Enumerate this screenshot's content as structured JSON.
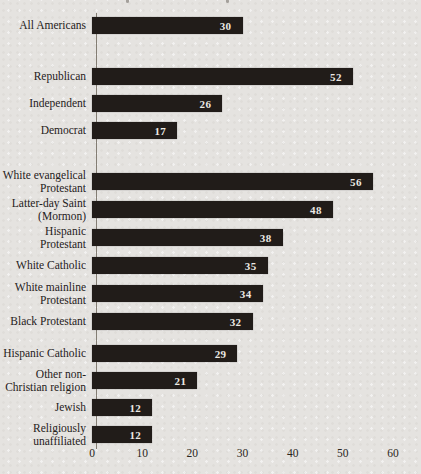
{
  "page": {
    "background_color": "#e5e3e0"
  },
  "chart_data": {
    "type": "bar",
    "orientation": "horizontal",
    "title": "",
    "xlabel": "",
    "ylabel": "",
    "xlim": [
      0,
      60
    ],
    "x_ticks": [
      "0",
      "10",
      "20",
      "30",
      "40",
      "50",
      "60"
    ],
    "grid": false,
    "legend": null,
    "bar_color": "#211c19",
    "value_label_color": "#ece9e4",
    "categories": [
      "All Americans",
      "Republican",
      "Independent",
      "Democrat",
      "White evangelical\nProtestant",
      "Latter-day Saint\n(Mormon)",
      "Hispanic\nProtestant",
      "White Catholic",
      "White mainline\nProtestant",
      "Black Protestant",
      "Hispanic Catholic",
      "Other non-\nChristian religion",
      "Jewish",
      "Religiously\nunaffiliated"
    ],
    "values": [
      30,
      52,
      26,
      17,
      56,
      48,
      38,
      35,
      34,
      32,
      29,
      21,
      12,
      12
    ],
    "groups": [
      {
        "name": "overall",
        "indices": [
          0
        ]
      },
      {
        "name": "party",
        "indices": [
          1,
          2,
          3
        ]
      },
      {
        "name": "religion-upper",
        "indices": [
          4,
          5,
          6,
          7,
          8,
          9
        ]
      },
      {
        "name": "religion-lower",
        "indices": [
          10,
          11,
          12,
          13
        ]
      }
    ]
  }
}
